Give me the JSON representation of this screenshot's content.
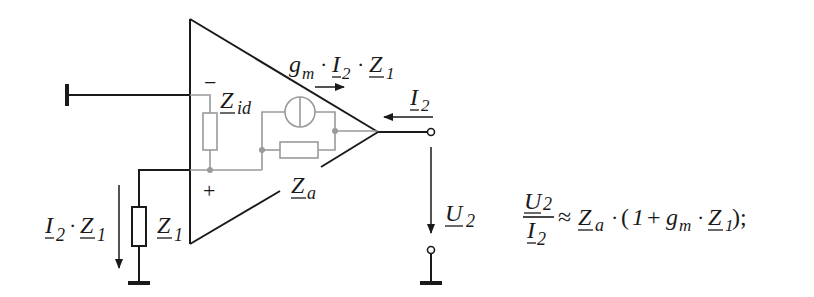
{
  "diagram": {
    "title": "",
    "labels": {
      "transconductance_current": {
        "g": "g",
        "g_sub": "m",
        "dot1": "·",
        "I": "I",
        "I_sub": "2",
        "dot2": "·",
        "Z": "Z",
        "Z_sub": "1"
      },
      "input_impedance": {
        "main": "Z",
        "sub": "id"
      },
      "output_impedance": {
        "main": "Z",
        "sub": "a"
      },
      "output_current": {
        "main": "I",
        "sub": "2"
      },
      "output_voltage": {
        "main": "U",
        "sub": "2"
      },
      "feedback_impedance": {
        "main": "Z",
        "sub": "1"
      },
      "feedback_voltage": {
        "I": "I",
        "I_sub": "2",
        "dot": "·",
        "Z": "Z",
        "Z_sub": "1"
      },
      "minus_input": "−",
      "plus_input": "+"
    },
    "formula": {
      "num_main": "U",
      "num_sub": "2",
      "den_main": "I",
      "den_sub": "2",
      "approx": "≈",
      "Za_main": "Z",
      "Za_sub": "a",
      "dot1": "·",
      "open": "(",
      "one": "1",
      "plus": "+",
      "g": "g",
      "g_sub": "m",
      "dot2": "·",
      "Z1_main": "Z",
      "Z1_sub": "1",
      "close": ");"
    },
    "colors": {
      "ink": "#1a1a1a",
      "internal": "#9a9a9a",
      "background": "#ffffff"
    }
  }
}
